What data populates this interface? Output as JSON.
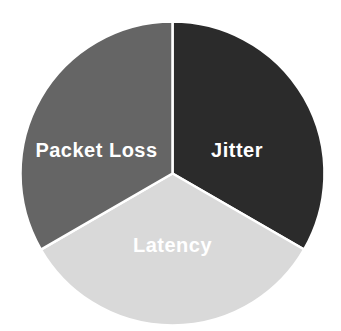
{
  "chart_data": {
    "type": "pie",
    "labels": [
      "Jitter",
      "Latency",
      "Packet Loss"
    ],
    "values": [
      33.33,
      33.33,
      33.34
    ],
    "colors": [
      "#2b2b2b",
      "#d9d9d9",
      "#656565"
    ],
    "slice_label_color": "#ffffff",
    "divider_color": "#ffffff",
    "background_color": "#ffffff",
    "start_angle_deg": 0,
    "direction": "clockwise",
    "title": "",
    "legend": "none"
  }
}
